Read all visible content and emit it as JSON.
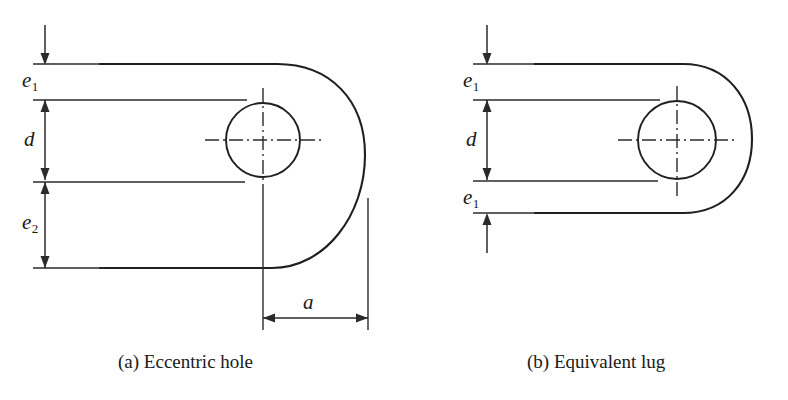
{
  "figure": {
    "background_color": "#ffffff",
    "line_color": "#1f1f1f",
    "panels": [
      {
        "id": "panel-a",
        "caption": "(a) Eccentric hole",
        "dimensions": [
          {
            "key": "e1",
            "base": "e",
            "sub": "1"
          },
          {
            "key": "d",
            "base": "d",
            "sub": ""
          },
          {
            "key": "e2",
            "base": "e",
            "sub": "2"
          },
          {
            "key": "a",
            "base": "a",
            "sub": ""
          }
        ]
      },
      {
        "id": "panel-b",
        "caption": "(b) Equivalent lug",
        "dimensions": [
          {
            "key": "e1-top",
            "base": "e",
            "sub": "1"
          },
          {
            "key": "d",
            "base": "d",
            "sub": ""
          },
          {
            "key": "e1-bottom",
            "base": "e",
            "sub": "1"
          }
        ]
      }
    ],
    "labels": {
      "panel_a_e1": "e",
      "panel_a_e1_sub": "1",
      "panel_a_d": "d",
      "panel_a_e2": "e",
      "panel_a_e2_sub": "2",
      "panel_a_a": "a",
      "panel_b_e1_top": "e",
      "panel_b_e1_top_sub": "1",
      "panel_b_d": "d",
      "panel_b_e1_bottom": "e",
      "panel_b_e1_bottom_sub": "1"
    },
    "captions": {
      "panel_a": "(a) Eccentric hole",
      "panel_b": "(b) Equivalent lug"
    }
  }
}
